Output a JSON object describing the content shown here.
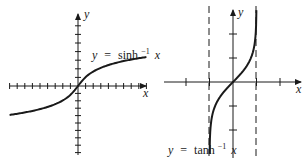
{
  "figure": {
    "background": "#ffffff",
    "ink_color": "#1a1a1a"
  },
  "chart_data": [
    {
      "type": "line",
      "title": "",
      "function": "y = sinh^-1 x",
      "label": {
        "lhs": "y",
        "eq": "=",
        "fn": "sinh",
        "sup": "−1",
        "arg": "x"
      },
      "xlabel": "x",
      "ylabel": "y",
      "grid": false,
      "x_ticks_left": 9,
      "x_ticks_right": 9,
      "y_ticks_up": 7,
      "y_ticks_down": 9,
      "xlim": [
        -9,
        9
      ],
      "ylim": [
        -9,
        8
      ],
      "x": [
        -9,
        -6,
        -4,
        -3,
        -2,
        -1,
        -0.5,
        0,
        0.5,
        1,
        2,
        3,
        4,
        6,
        9
      ],
      "y": [
        -2.89,
        -2.49,
        -2.09,
        -1.82,
        -1.44,
        -0.88,
        -0.48,
        0,
        0.48,
        0.88,
        1.44,
        1.82,
        2.09,
        2.49,
        2.89
      ]
    },
    {
      "type": "line",
      "title": "",
      "function": "y = tanh^-1 x",
      "label": {
        "lhs": "y",
        "eq": "=",
        "fn": "tanh",
        "sup": "−1",
        "arg": "x"
      },
      "xlabel": "x",
      "ylabel": "y",
      "grid": false,
      "asymptotes": [
        -1,
        1
      ],
      "x_ticks": [
        -2,
        -1,
        1,
        2
      ],
      "y_ticks": [
        -2,
        -1,
        1,
        2
      ],
      "xlim": [
        -3,
        3
      ],
      "ylim": [
        -3,
        3
      ],
      "x": [
        -0.995,
        -0.99,
        -0.95,
        -0.9,
        -0.75,
        -0.5,
        -0.25,
        0,
        0.25,
        0.5,
        0.75,
        0.9,
        0.95,
        0.99,
        0.995
      ],
      "y": [
        -2.99,
        -2.65,
        -1.83,
        -1.47,
        -0.97,
        -0.55,
        -0.26,
        0,
        0.26,
        0.55,
        0.97,
        1.47,
        1.83,
        2.65,
        2.99
      ]
    }
  ]
}
